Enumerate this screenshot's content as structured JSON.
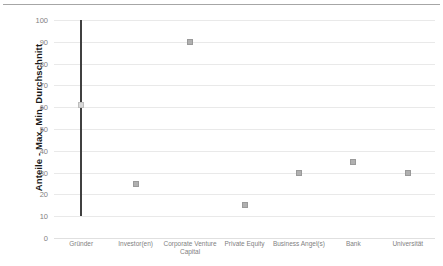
{
  "chart_data": {
    "type": "scatter",
    "title": "",
    "subtitle": "",
    "xlabel": "",
    "ylabel": "Anteile - Max, Min, Durchschnitt",
    "ylim": [
      0,
      100
    ],
    "yticks": [
      0,
      10,
      20,
      30,
      40,
      50,
      60,
      70,
      80,
      90,
      100
    ],
    "ytick_labels": [
      "0",
      "10",
      "20",
      "30",
      "40",
      "50",
      "60",
      "70",
      "80",
      "90",
      "100"
    ],
    "grid": true,
    "legend": "none",
    "categories": [
      "Gründer",
      "Investor(en)",
      "Corporate Venture Capital",
      "Private Equity",
      "Business Angel(s)",
      "Bank",
      "Universität"
    ],
    "series": [
      {
        "name": "Max",
        "values": [
          100,
          25,
          90,
          15,
          30,
          35,
          30
        ]
      },
      {
        "name": "Min",
        "values": [
          10,
          25,
          90,
          15,
          30,
          35,
          30
        ]
      },
      {
        "name": "Durchschnitt",
        "values": [
          61,
          25,
          90,
          15,
          30,
          35,
          30
        ]
      }
    ],
    "points": [
      {
        "category": "Gründer",
        "max": 100,
        "min": 10,
        "avg": 61
      },
      {
        "category": "Investor(en)",
        "max": 25,
        "min": 25,
        "avg": 25
      },
      {
        "category": "Corporate Venture Capital",
        "max": 90,
        "min": 90,
        "avg": 90
      },
      {
        "category": "Private Equity",
        "max": 15,
        "min": 15,
        "avg": 15
      },
      {
        "category": "Business Angel(s)",
        "max": 30,
        "min": 30,
        "avg": 30
      },
      {
        "category": "Bank",
        "max": 35,
        "min": 35,
        "avg": 35
      },
      {
        "category": "Universität",
        "max": 30,
        "min": 30,
        "avg": 30
      }
    ],
    "colors": {
      "range_bar": "#404040",
      "marker": "#b0b0b0",
      "gridline": "#e9e9e9",
      "tick_text": "#7f7f7f",
      "axis_title": "#1a1a1a",
      "top_rule": "#a6a6a6",
      "background": "#ffffff"
    }
  }
}
